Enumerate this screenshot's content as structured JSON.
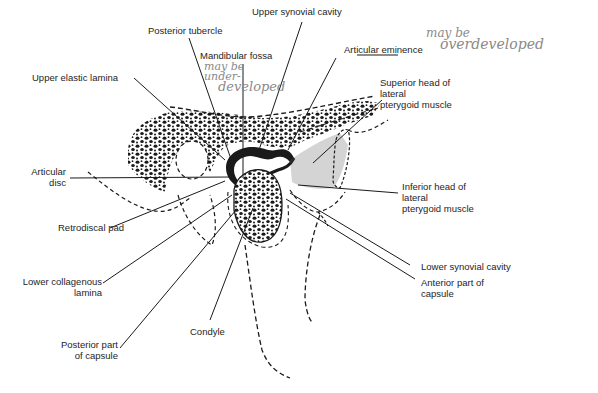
{
  "diagram": {
    "labels": {
      "upper_synovial_cavity": "Upper synovial cavity",
      "posterior_tubercle": "Posterior tubercle",
      "mandibular_fossa": "Mandibular fossa",
      "articular_eminence": "Articular eminence",
      "upper_elastic_lamina": "Upper elastic lamina",
      "superior_head_1": "Superior head of",
      "superior_head_2": "lateral",
      "superior_head_3": "pterygoid muscle",
      "articular_disc_1": "Articular",
      "articular_disc_2": "disc",
      "inferior_head_1": "Inferior head of",
      "inferior_head_2": "lateral",
      "inferior_head_3": "pterygoid muscle",
      "retrodiscal_pad": "Retrodiscal pad",
      "lower_synovial_cavity": "Lower synovial cavity",
      "lower_collagenous_1": "Lower collagenous",
      "lower_collagenous_2": "lamina",
      "anterior_capsule_1": "Anterior part of",
      "anterior_capsule_2": "capsule",
      "condyle": "Condyle",
      "posterior_capsule_1": "Posterior part",
      "posterior_capsule_2": "of capsule"
    },
    "annotations": {
      "fossa_note_1": "may be",
      "fossa_note_2": "under-",
      "fossa_note_3": "developed",
      "eminence_note_1": "may be",
      "eminence_note_2": "overdeveloped"
    },
    "colors": {
      "ink": "#1a1a1a",
      "handwriting": "#8a8a8a",
      "background": "#ffffff"
    }
  }
}
